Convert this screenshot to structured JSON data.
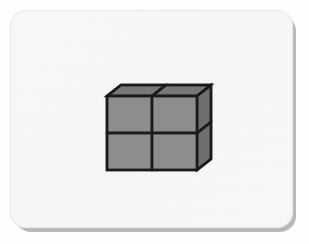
{
  "scene": {
    "title": "Stacked unit cubes figure",
    "background_color": "#fefefe",
    "card": {
      "name": "paper-card",
      "fill_color": "#f2f2f2",
      "shadow_color": "#b9b9b9",
      "corner_radius": 16,
      "x": 10,
      "y": 10,
      "width": 283,
      "height": 218
    }
  },
  "figure": {
    "kind": "isometric-cube-stack",
    "cube_count": 4,
    "rows": 2,
    "columns": 2,
    "depth_layers": 1,
    "projection": "oblique",
    "colors": {
      "front_face": "#8d8d8d",
      "top_face": "#777777",
      "side_face": "#6f6f6f",
      "outline": "#1a1a1a"
    },
    "geometry": {
      "front_origin_x": 107,
      "front_origin_y": 96,
      "cell_width": 45,
      "cell_height": 37,
      "depth_dx": 14,
      "depth_dy": -11,
      "stroke_width": 2.4
    },
    "faces": [
      {
        "name": "front-face-top-left",
        "kind": "front",
        "row": 0,
        "column": 0
      },
      {
        "name": "front-face-top-right",
        "kind": "front",
        "row": 0,
        "column": 1
      },
      {
        "name": "front-face-bottom-left",
        "kind": "front",
        "row": 1,
        "column": 0
      },
      {
        "name": "front-face-bottom-right",
        "kind": "front",
        "row": 1,
        "column": 1
      },
      {
        "name": "top-face-left",
        "kind": "top",
        "row": 0,
        "column": 0
      },
      {
        "name": "top-face-right",
        "kind": "top",
        "row": 0,
        "column": 1
      },
      {
        "name": "side-face-upper",
        "kind": "side",
        "row": 0,
        "column": 1
      },
      {
        "name": "side-face-lower",
        "kind": "side",
        "row": 1,
        "column": 1
      }
    ]
  }
}
